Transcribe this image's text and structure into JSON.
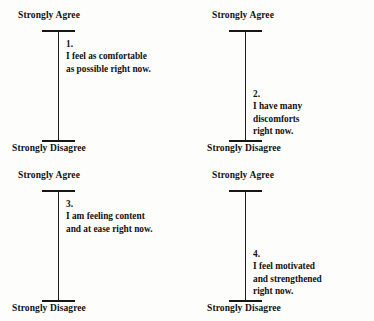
{
  "document": {
    "type": "visual-analogue-scale-questionnaire",
    "anchor_top": "Strongly Agree",
    "anchor_bottom": "Strongly Disagree"
  },
  "items": [
    {
      "number": "1.",
      "position": "top-left",
      "text_position": "upper",
      "lines": [
        "I feel as comfortable",
        "as possible right now."
      ],
      "anchor_top": "Strongly Agree",
      "anchor_bottom": "Strongly Disagree"
    },
    {
      "number": "2.",
      "position": "top-right",
      "text_position": "lower",
      "lines": [
        "I have many",
        "discomforts",
        "right now."
      ],
      "anchor_top": "Strongly Agree",
      "anchor_bottom": "Strongly Disagree"
    },
    {
      "number": "3.",
      "position": "bottom-left",
      "text_position": "upper",
      "lines": [
        "I am feeling content",
        "and at ease right now."
      ],
      "anchor_top": "Strongly Agree",
      "anchor_bottom": "Strongly Disagree"
    },
    {
      "number": "4.",
      "position": "bottom-right",
      "text_position": "lower",
      "lines": [
        "I feel motivated",
        "and strengthened",
        "right now."
      ],
      "anchor_top": "Strongly Agree",
      "anchor_bottom": "Strongly Disagree"
    }
  ],
  "colors": {
    "ink": "#121212",
    "line": "#1b1b1b",
    "paper": "#fdfdfc"
  }
}
